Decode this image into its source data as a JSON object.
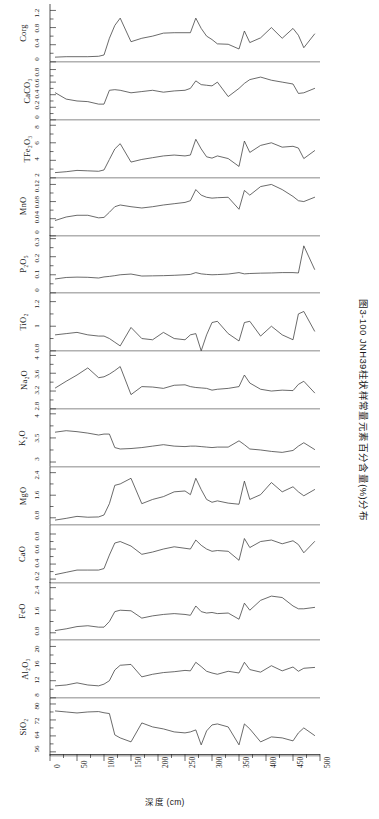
{
  "figure": {
    "caption": "图3-100  JNH39柱状样常量元素百分含量(%)分布",
    "xlabel": "深度 (cm)"
  },
  "chart_data": {
    "type": "line",
    "title": "图3-100  JNH39柱状样常量元素百分含量(%)分布",
    "xlabel": "深度 (cm)",
    "ylabel": "",
    "xlim": [
      0,
      500
    ],
    "xticks": [
      0,
      50,
      100,
      150,
      200,
      250,
      300,
      350,
      400,
      450,
      500
    ],
    "xticklabels": [
      "0",
      "50",
      "100",
      "150",
      "200",
      "250",
      "300",
      "350",
      "400",
      "450",
      "500"
    ],
    "grid": false,
    "legend": "none",
    "x": [
      10,
      30,
      50,
      70,
      90,
      100,
      110,
      120,
      130,
      150,
      170,
      190,
      210,
      230,
      250,
      260,
      270,
      280,
      290,
      300,
      310,
      330,
      350,
      360,
      370,
      390,
      410,
      430,
      450,
      460,
      470,
      490
    ],
    "panels": [
      {
        "name": "Corg",
        "label": "Corg",
        "ylim": [
          0,
          1.35
        ],
        "yticks": [
          0,
          0.4,
          0.8,
          1.2
        ],
        "yticklabels": [
          "0",
          "0.4",
          "0.8",
          "1.2"
        ],
        "values": [
          0.11,
          0.12,
          0.12,
          0.12,
          0.13,
          0.16,
          0.55,
          0.85,
          1.02,
          0.47,
          0.55,
          0.6,
          0.67,
          0.68,
          0.68,
          0.68,
          1.02,
          0.78,
          0.6,
          0.52,
          0.42,
          0.41,
          0.3,
          0.72,
          0.45,
          0.56,
          0.8,
          0.55,
          0.78,
          0.62,
          0.33,
          0.65
        ]
      },
      {
        "name": "CaCO3",
        "label": "CaCO₃",
        "ylim": [
          0,
          0.92
        ],
        "yticks": [
          0,
          0.2,
          0.4,
          0.6,
          0.8
        ],
        "yticklabels": [
          "0",
          "0.2",
          "0.4",
          "0.6",
          "0.8"
        ],
        "values": [
          0.43,
          0.33,
          0.3,
          0.29,
          0.25,
          0.25,
          0.47,
          0.48,
          0.47,
          0.43,
          0.45,
          0.47,
          0.44,
          0.46,
          0.47,
          0.5,
          0.62,
          0.56,
          0.55,
          0.54,
          0.6,
          0.37,
          0.5,
          0.58,
          0.64,
          0.68,
          0.63,
          0.6,
          0.57,
          0.42,
          0.43,
          0.5
        ]
      },
      {
        "name": "TFe2O3",
        "label": "TFe₂O₃",
        "ylim": [
          2,
          8.6
        ],
        "yticks": [
          2,
          4,
          6,
          8
        ],
        "yticklabels": [
          "2",
          "4",
          "6",
          "8"
        ],
        "values": [
          2.6,
          2.7,
          2.85,
          2.8,
          2.75,
          2.9,
          4.1,
          5.3,
          5.9,
          3.8,
          4.1,
          4.3,
          4.5,
          4.6,
          4.5,
          4.6,
          6.4,
          5.3,
          4.4,
          4.25,
          4.5,
          4.2,
          3.3,
          6.2,
          4.9,
          5.7,
          6.0,
          5.5,
          5.6,
          5.4,
          4.2,
          5.1
        ]
      },
      {
        "name": "MnO",
        "label": "MnO",
        "ylim": [
          0,
          0.135
        ],
        "yticks": [
          0,
          0.04,
          0.08,
          0.12
        ],
        "yticklabels": [
          "0",
          "0.04",
          "0.08",
          "0.12"
        ],
        "values": [
          0.036,
          0.044,
          0.048,
          0.048,
          0.042,
          0.043,
          0.055,
          0.068,
          0.072,
          0.068,
          0.065,
          0.068,
          0.072,
          0.075,
          0.078,
          0.082,
          0.108,
          0.095,
          0.09,
          0.088,
          0.089,
          0.09,
          0.062,
          0.106,
          0.095,
          0.115,
          0.12,
          0.108,
          0.092,
          0.082,
          0.08,
          0.09
        ]
      },
      {
        "name": "P2O5",
        "label": "P₂O₅",
        "ylim": [
          0,
          0.32
        ],
        "yticks": [
          0,
          0.1,
          0.2,
          0.3
        ],
        "yticklabels": [
          "0",
          "0.1",
          "0.2",
          "0.3"
        ],
        "values": [
          0.077,
          0.085,
          0.087,
          0.086,
          0.082,
          0.088,
          0.091,
          0.095,
          0.1,
          0.104,
          0.093,
          0.094,
          0.095,
          0.097,
          0.1,
          0.102,
          0.112,
          0.105,
          0.102,
          0.1,
          0.101,
          0.104,
          0.112,
          0.105,
          0.107,
          0.109,
          0.11,
          0.112,
          0.112,
          0.11,
          0.26,
          0.13
        ]
      },
      {
        "name": "TiO2",
        "label": "TiO₂",
        "ylim": [
          0.8,
          1.27
        ],
        "yticks": [
          0.8,
          1,
          1.2
        ],
        "yticklabels": [
          "0.8",
          "1",
          "1.2"
        ],
        "values": [
          0.93,
          0.94,
          0.95,
          0.93,
          0.92,
          0.92,
          0.9,
          0.87,
          0.84,
          0.99,
          0.9,
          0.89,
          0.95,
          0.9,
          0.89,
          0.93,
          0.94,
          0.8,
          0.93,
          1.03,
          1.04,
          0.94,
          0.88,
          1.03,
          1.04,
          0.92,
          1.0,
          0.93,
          0.89,
          1.1,
          1.12,
          0.96
        ]
      },
      {
        "name": "Na2O",
        "label": "Na₂O",
        "ylim": [
          2.8,
          4.1
        ],
        "yticks": [
          2.8,
          3.2,
          3.6,
          4
        ],
        "yticklabels": [
          "2.8",
          "3.2",
          "3.6",
          "4"
        ],
        "values": [
          3.27,
          3.42,
          3.56,
          3.72,
          3.5,
          3.52,
          3.58,
          3.66,
          3.75,
          3.12,
          3.3,
          3.29,
          3.26,
          3.33,
          3.34,
          3.3,
          3.28,
          3.27,
          3.26,
          3.22,
          3.24,
          3.26,
          3.3,
          3.56,
          3.38,
          3.24,
          3.2,
          3.22,
          3.21,
          3.35,
          3.42,
          3.16
        ]
      },
      {
        "name": "K2O",
        "label": "K₂O",
        "ylim": [
          2.9,
          4.1
        ],
        "yticks": [
          3,
          3.5,
          4
        ],
        "yticklabels": [
          "3",
          "3.5",
          "4"
        ],
        "values": [
          3.62,
          3.65,
          3.63,
          3.6,
          3.56,
          3.58,
          3.58,
          3.3,
          3.27,
          3.28,
          3.3,
          3.33,
          3.36,
          3.33,
          3.32,
          3.33,
          3.33,
          3.32,
          3.31,
          3.3,
          3.31,
          3.31,
          3.44,
          3.36,
          3.27,
          3.25,
          3.22,
          3.2,
          3.24,
          3.33,
          3.4,
          3.26
        ]
      },
      {
        "name": "MgO",
        "label": "MgO",
        "ylim": [
          0.55,
          2.6
        ],
        "yticks": [
          0.8,
          1.6,
          2.4
        ],
        "yticklabels": [
          "0.8",
          "1.6",
          "2.4"
        ],
        "values": [
          0.72,
          0.78,
          0.85,
          0.82,
          0.83,
          0.9,
          1.3,
          1.95,
          2.0,
          2.2,
          1.3,
          1.45,
          1.55,
          1.72,
          1.75,
          1.62,
          2.2,
          1.8,
          1.45,
          1.35,
          1.4,
          1.32,
          1.28,
          2.1,
          1.45,
          1.62,
          2.05,
          1.72,
          1.9,
          1.72,
          1.58,
          1.8
        ]
      },
      {
        "name": "CaO",
        "label": "CaO",
        "ylim": [
          0.15,
          0.92
        ],
        "yticks": [
          0.2,
          0.4,
          0.6,
          0.8
        ],
        "yticklabels": [
          "0.2",
          "0.4",
          "0.6",
          "0.8"
        ],
        "values": [
          0.26,
          0.29,
          0.32,
          0.32,
          0.32,
          0.34,
          0.52,
          0.68,
          0.7,
          0.64,
          0.53,
          0.56,
          0.6,
          0.63,
          0.61,
          0.6,
          0.72,
          0.65,
          0.6,
          0.57,
          0.58,
          0.57,
          0.45,
          0.74,
          0.62,
          0.7,
          0.72,
          0.67,
          0.71,
          0.66,
          0.55,
          0.7
        ]
      },
      {
        "name": "FeO",
        "label": "FeO",
        "ylim": [
          0.55,
          2.6
        ],
        "yticks": [
          0.8,
          1.6,
          2.4
        ],
        "yticklabels": [
          "0.8",
          "1.6",
          "2.4"
        ],
        "values": [
          0.88,
          0.94,
          1.02,
          1.05,
          1.0,
          1.0,
          1.2,
          1.55,
          1.6,
          1.58,
          1.32,
          1.4,
          1.45,
          1.48,
          1.45,
          1.42,
          1.75,
          1.55,
          1.5,
          1.52,
          1.48,
          1.5,
          1.28,
          1.85,
          1.6,
          1.95,
          2.1,
          2.05,
          1.75,
          1.65,
          1.65,
          1.7
        ]
      },
      {
        "name": "Al2O3",
        "label": "Al₂O₃",
        "ylim": [
          8,
          21.5
        ],
        "yticks": [
          8,
          12,
          16,
          20
        ],
        "yticklabels": [
          "8",
          "12",
          "16",
          "20"
        ],
        "values": [
          10.8,
          11.0,
          11.5,
          11.0,
          10.8,
          11.2,
          12.0,
          14.5,
          15.6,
          15.8,
          12.9,
          13.5,
          13.9,
          14.1,
          14.4,
          14.3,
          16.3,
          15.3,
          14.2,
          13.8,
          13.5,
          14.2,
          13.8,
          16.3,
          14.6,
          14.0,
          15.5,
          14.3,
          15.2,
          14.2,
          14.9,
          15.1
        ]
      },
      {
        "name": "SiO2",
        "label": "SiO₂",
        "ylim": [
          54,
          83
        ],
        "yticks": [
          56,
          64,
          72,
          80
        ],
        "yticklabels": [
          "56",
          "64",
          "72",
          "80"
        ],
        "values": [
          76.5,
          76.0,
          75.5,
          76.0,
          76.2,
          75.6,
          75.2,
          64.5,
          63.0,
          61.0,
          70.5,
          68.5,
          67.5,
          66.0,
          65.5,
          66.0,
          67.0,
          59.5,
          66.5,
          69.5,
          70.0,
          68.5,
          59.5,
          70.0,
          67.5,
          61.0,
          63.5,
          63.0,
          61.5,
          65.5,
          68.0,
          64.2
        ]
      }
    ]
  }
}
